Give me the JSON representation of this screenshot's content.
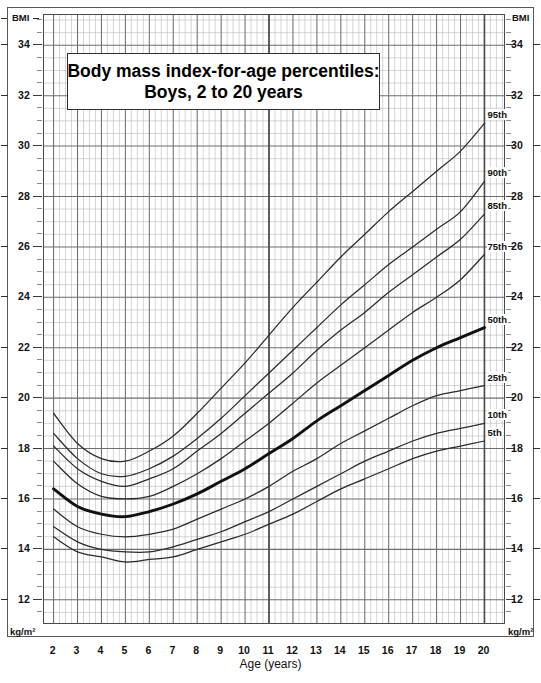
{
  "title": {
    "line1": "Body mass index-for-age percentiles:",
    "line2": "Boys, 2 to 20 years"
  },
  "axes": {
    "y_top_label_left": "BMI",
    "y_top_label_right": "BMI",
    "y_unit_left": "kg/m²",
    "y_unit_right": "kg/m²",
    "x_title": "Age (years)",
    "y_ticks": [
      34,
      32,
      30,
      28,
      26,
      24,
      22,
      20,
      18,
      16,
      14,
      12
    ],
    "x_ticks": [
      2,
      3,
      4,
      5,
      6,
      7,
      8,
      9,
      10,
      11,
      12,
      13,
      14,
      15,
      16,
      17,
      18,
      19,
      20
    ],
    "ylim": [
      11.0,
      35.2
    ],
    "xlim": [
      1.6,
      20.9
    ],
    "grid": "minor grid every 0.25 year and 0.5 BMI; major grid every 1 year and 2 BMI"
  },
  "chart_data": {
    "type": "line",
    "title": "Body mass index-for-age percentiles: Boys, 2 to 20 years",
    "xlabel": "Age (years)",
    "ylabel": "BMI (kg/m²)",
    "xlim": [
      2,
      20
    ],
    "ylim": [
      12,
      35
    ],
    "grid": true,
    "legend_position": "right-inline-labels",
    "x": [
      2,
      3,
      4,
      5,
      6,
      7,
      8,
      9,
      10,
      11,
      12,
      13,
      14,
      15,
      16,
      17,
      18,
      19,
      20
    ],
    "series": [
      {
        "name": "95th",
        "label": "95th",
        "end_value": 30.9,
        "values": [
          19.4,
          18.2,
          17.6,
          17.5,
          17.9,
          18.5,
          19.4,
          20.4,
          21.4,
          22.5,
          23.6,
          24.6,
          25.6,
          26.5,
          27.4,
          28.2,
          29.0,
          29.8,
          30.9
        ]
      },
      {
        "name": "90th",
        "label": "90th",
        "end_value": 28.6,
        "values": [
          18.6,
          17.6,
          17.0,
          16.9,
          17.2,
          17.7,
          18.4,
          19.2,
          20.1,
          21.0,
          21.9,
          22.8,
          23.7,
          24.5,
          25.3,
          26.0,
          26.7,
          27.4,
          28.6
        ]
      },
      {
        "name": "85th",
        "label": "85th",
        "end_value": 27.3,
        "values": [
          18.1,
          17.2,
          16.7,
          16.5,
          16.8,
          17.2,
          17.9,
          18.6,
          19.4,
          20.2,
          21.0,
          21.9,
          22.7,
          23.4,
          24.2,
          24.9,
          25.6,
          26.3,
          27.3
        ]
      },
      {
        "name": "75th",
        "label": "75th",
        "end_value": 25.7,
        "values": [
          17.5,
          16.6,
          16.1,
          16.0,
          16.1,
          16.5,
          17.0,
          17.6,
          18.3,
          19.0,
          19.8,
          20.6,
          21.3,
          22.0,
          22.7,
          23.4,
          24.0,
          24.7,
          25.7
        ]
      },
      {
        "name": "50th",
        "label": "50th",
        "emphasis": true,
        "end_value": 22.8,
        "values": [
          16.4,
          15.7,
          15.4,
          15.3,
          15.5,
          15.8,
          16.2,
          16.7,
          17.2,
          17.8,
          18.4,
          19.1,
          19.7,
          20.3,
          20.9,
          21.5,
          22.0,
          22.4,
          22.8
        ]
      },
      {
        "name": "25th",
        "label": "25th",
        "end_value": 20.5,
        "values": [
          15.6,
          14.9,
          14.6,
          14.5,
          14.6,
          14.8,
          15.2,
          15.6,
          16.0,
          16.5,
          17.1,
          17.6,
          18.2,
          18.7,
          19.2,
          19.7,
          20.1,
          20.3,
          20.5
        ]
      },
      {
        "name": "10th",
        "label": "10th",
        "end_value": 19.0,
        "values": [
          14.9,
          14.3,
          14.0,
          13.9,
          13.9,
          14.1,
          14.4,
          14.7,
          15.1,
          15.5,
          16.0,
          16.5,
          17.0,
          17.5,
          17.9,
          18.3,
          18.6,
          18.8,
          19.0
        ]
      },
      {
        "name": "5th",
        "label": "5th",
        "end_value": 18.3,
        "values": [
          14.5,
          13.9,
          13.7,
          13.5,
          13.6,
          13.7,
          14.0,
          14.3,
          14.6,
          15.0,
          15.4,
          15.9,
          16.4,
          16.8,
          17.2,
          17.6,
          17.9,
          18.1,
          18.3
        ]
      }
    ]
  },
  "colors": {
    "curve": "#2b2b2d",
    "curve_emphasis": "#111113",
    "grid_minor": "#b9b9bb",
    "grid_major": "#6e6e70",
    "frame": "#58585a",
    "background": "#ffffff"
  }
}
